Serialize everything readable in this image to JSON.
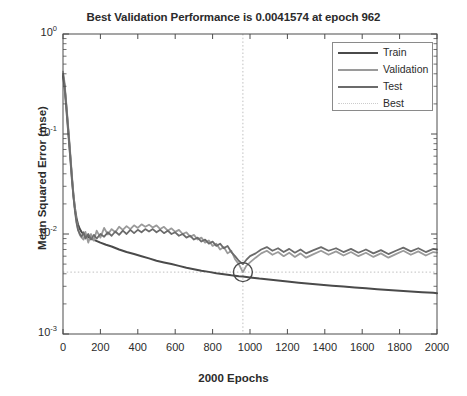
{
  "chart_data": {
    "type": "line",
    "title": "Best Validation Performance is 0.0041574 at epoch 962",
    "xlabel": "2000 Epochs",
    "ylabel": "Mean Squared Error (mse)",
    "yscale": "log",
    "xscale": "linear",
    "xlim": [
      0,
      2000
    ],
    "ylim": [
      0.001,
      1
    ],
    "grid": false,
    "legend_position": "top-right",
    "best_epoch": 962,
    "best_value": 0.0041574,
    "xticks": [
      0,
      200,
      400,
      600,
      800,
      1000,
      1200,
      1400,
      1600,
      1800,
      2000
    ],
    "yticks": [
      "10^0",
      "10^-1",
      "10^-2",
      "10^-3"
    ],
    "ytick_labels": [
      "10",
      "10",
      "10",
      "10"
    ],
    "ytick_exponents": [
      "0",
      "-1",
      "-2",
      "-3"
    ],
    "series": [
      {
        "name": "Train",
        "color": "#4a4a4a",
        "width": 2.0,
        "x": [
          0,
          8,
          16,
          24,
          32,
          40,
          48,
          56,
          64,
          72,
          80,
          90,
          100,
          115,
          130,
          150,
          175,
          200,
          230,
          260,
          300,
          340,
          380,
          420,
          460,
          500,
          540,
          580,
          620,
          660,
          700,
          740,
          780,
          820,
          860,
          900,
          940,
          962,
          1000,
          1050,
          1100,
          1150,
          1200,
          1260,
          1320,
          1380,
          1440,
          1500,
          1560,
          1620,
          1680,
          1740,
          1800,
          1860,
          1920,
          1980,
          2000
        ],
        "y": [
          0.38,
          0.3,
          0.2,
          0.13,
          0.085,
          0.055,
          0.035,
          0.024,
          0.018,
          0.0145,
          0.0125,
          0.0112,
          0.0104,
          0.0098,
          0.0094,
          0.009,
          0.0086,
          0.0082,
          0.0078,
          0.0075,
          0.007,
          0.0066,
          0.0063,
          0.006,
          0.0057,
          0.0054,
          0.0052,
          0.005,
          0.0048,
          0.0046,
          0.00445,
          0.0043,
          0.00418,
          0.00406,
          0.00396,
          0.00386,
          0.00378,
          0.00375,
          0.00368,
          0.00358,
          0.0035,
          0.00342,
          0.00335,
          0.00326,
          0.00318,
          0.00311,
          0.00304,
          0.00298,
          0.00292,
          0.00286,
          0.00281,
          0.00276,
          0.00271,
          0.00266,
          0.00262,
          0.00258,
          0.00256
        ]
      },
      {
        "name": "Validation",
        "color": "#9a9a9a",
        "width": 1.8,
        "x": [
          0,
          8,
          16,
          24,
          32,
          40,
          48,
          56,
          64,
          72,
          80,
          90,
          100,
          110,
          120,
          135,
          150,
          165,
          180,
          200,
          220,
          240,
          260,
          280,
          300,
          320,
          340,
          360,
          380,
          400,
          420,
          440,
          460,
          480,
          500,
          520,
          540,
          560,
          580,
          600,
          620,
          640,
          660,
          680,
          700,
          720,
          740,
          760,
          780,
          800,
          820,
          840,
          860,
          880,
          900,
          920,
          940,
          962,
          980,
          1000,
          1030,
          1060,
          1090,
          1120,
          1150,
          1180,
          1210,
          1240,
          1270,
          1300,
          1340,
          1380,
          1420,
          1460,
          1500,
          1540,
          1580,
          1620,
          1660,
          1700,
          1740,
          1780,
          1820,
          1860,
          1900,
          1940,
          1980,
          2000
        ],
        "y": [
          0.42,
          0.33,
          0.22,
          0.145,
          0.095,
          0.06,
          0.038,
          0.025,
          0.0175,
          0.0135,
          0.0112,
          0.0098,
          0.0092,
          0.0088,
          0.0105,
          0.0082,
          0.01,
          0.0086,
          0.0108,
          0.0092,
          0.0115,
          0.0099,
          0.0112,
          0.0104,
          0.0118,
          0.011,
          0.012,
          0.0112,
          0.0122,
          0.0115,
          0.0125,
          0.0118,
          0.0124,
          0.0116,
          0.0122,
          0.0112,
          0.0118,
          0.0108,
          0.0114,
          0.0105,
          0.011,
          0.01,
          0.0104,
          0.0094,
          0.0098,
          0.0088,
          0.0092,
          0.0082,
          0.0086,
          0.0076,
          0.008,
          0.007,
          0.0074,
          0.0064,
          0.0068,
          0.0056,
          0.005,
          0.0041574,
          0.0048,
          0.0052,
          0.0058,
          0.0064,
          0.0068,
          0.0062,
          0.0066,
          0.006,
          0.0065,
          0.0059,
          0.0064,
          0.0058,
          0.0063,
          0.0068,
          0.0062,
          0.0067,
          0.0061,
          0.0066,
          0.006,
          0.0065,
          0.0059,
          0.0064,
          0.0058,
          0.0063,
          0.0068,
          0.0062,
          0.0067,
          0.0061,
          0.0066,
          0.0065
        ]
      },
      {
        "name": "Test",
        "color": "#6b6b6b",
        "width": 1.8,
        "x": [
          0,
          8,
          16,
          24,
          32,
          40,
          48,
          56,
          64,
          72,
          80,
          90,
          100,
          110,
          120,
          135,
          150,
          165,
          180,
          200,
          220,
          240,
          260,
          280,
          300,
          320,
          340,
          360,
          380,
          400,
          420,
          440,
          460,
          480,
          500,
          520,
          540,
          560,
          580,
          600,
          620,
          640,
          660,
          680,
          700,
          720,
          740,
          760,
          780,
          800,
          820,
          840,
          860,
          880,
          900,
          920,
          940,
          962,
          980,
          1000,
          1030,
          1060,
          1090,
          1120,
          1150,
          1180,
          1210,
          1240,
          1270,
          1300,
          1340,
          1380,
          1420,
          1460,
          1500,
          1540,
          1580,
          1620,
          1660,
          1700,
          1740,
          1780,
          1820,
          1860,
          1900,
          1940,
          1980,
          2000
        ],
        "y": [
          0.4,
          0.31,
          0.21,
          0.138,
          0.09,
          0.057,
          0.036,
          0.0235,
          0.0168,
          0.013,
          0.011,
          0.01,
          0.0094,
          0.0104,
          0.009,
          0.01,
          0.0088,
          0.0098,
          0.009,
          0.01,
          0.0094,
          0.0104,
          0.0096,
          0.0106,
          0.0098,
          0.0108,
          0.01,
          0.011,
          0.0102,
          0.011,
          0.0104,
          0.0112,
          0.0106,
          0.0112,
          0.0104,
          0.011,
          0.0102,
          0.0108,
          0.01,
          0.0104,
          0.0096,
          0.01,
          0.0092,
          0.0096,
          0.0088,
          0.0092,
          0.0084,
          0.0088,
          0.008,
          0.0084,
          0.0076,
          0.008,
          0.0072,
          0.0076,
          0.0066,
          0.006,
          0.0054,
          0.005,
          0.0055,
          0.006,
          0.0064,
          0.007,
          0.0074,
          0.0068,
          0.0072,
          0.0066,
          0.0071,
          0.0065,
          0.007,
          0.0064,
          0.0069,
          0.0074,
          0.0068,
          0.0072,
          0.0066,
          0.0071,
          0.0065,
          0.007,
          0.0064,
          0.0069,
          0.0063,
          0.0068,
          0.0073,
          0.0067,
          0.0072,
          0.0066,
          0.0071,
          0.007
        ]
      }
    ],
    "best_line": {
      "name": "Best",
      "color": "#bfbfbf",
      "style": "dotted"
    }
  },
  "legend": {
    "entries": [
      {
        "label": "Train",
        "color": "#4a4a4a",
        "style": "solid",
        "width": 2.4
      },
      {
        "label": "Validation",
        "color": "#9a9a9a",
        "style": "solid",
        "width": 2.0
      },
      {
        "label": "Test",
        "color": "#6b6b6b",
        "style": "solid",
        "width": 2.0
      },
      {
        "label": "Best",
        "color": "#cccccc",
        "style": "dotted",
        "width": 1.2
      }
    ]
  },
  "axes": {
    "xtick_labels": [
      "0",
      "200",
      "400",
      "600",
      "800",
      "1000",
      "1200",
      "1400",
      "1600",
      "1800",
      "2000"
    ],
    "ytick_mantissa": [
      "10",
      "10",
      "10",
      "10"
    ],
    "ytick_exponent": [
      "0",
      "-1",
      "-2",
      "-3"
    ]
  },
  "colors": {
    "axis": "#4d4d4d",
    "text": "#2b2b2b",
    "background": "#ffffff",
    "best_marker": "#4a4a4a"
  }
}
